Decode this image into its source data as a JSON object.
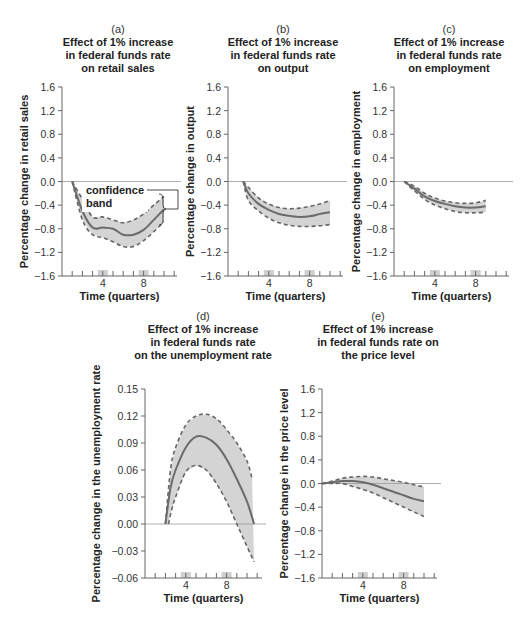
{
  "chart_data": [
    {
      "id": "a",
      "type": "line",
      "letter": "(a)",
      "title_lines": [
        "Effect of 1% increase",
        "in federal funds rate",
        "on retail sales"
      ],
      "xlabel": "Time (quarters)",
      "ylabel": "Percentage change in retail sales",
      "xticks_labeled": [
        4,
        8
      ],
      "ylim": [
        -1.6,
        1.6
      ],
      "yticks": [
        1.6,
        1.2,
        0.8,
        0.4,
        0.0,
        -0.4,
        -0.8,
        -1.2,
        -1.6
      ],
      "ytick_labels": [
        "1.6",
        "1.2",
        "0.8",
        "0.4",
        "0.0",
        "−0.4",
        "−0.8",
        "−1.2",
        "−1.6"
      ],
      "annotation": {
        "lines": [
          "confidence",
          "band"
        ]
      },
      "series": [
        {
          "name": "estimate",
          "x": [
            1,
            2,
            3,
            4,
            5,
            6,
            7,
            8,
            9,
            10
          ],
          "values": [
            0,
            -0.5,
            -0.78,
            -0.78,
            -0.8,
            -0.9,
            -0.9,
            -0.82,
            -0.65,
            -0.47
          ]
        },
        {
          "name": "upper confidence bound",
          "x": [
            1,
            2,
            3,
            4,
            5,
            6,
            7,
            8,
            9,
            10
          ],
          "values": [
            0,
            -0.3,
            -0.6,
            -0.6,
            -0.65,
            -0.7,
            -0.65,
            -0.55,
            -0.4,
            -0.25
          ]
        },
        {
          "name": "lower confidence bound",
          "x": [
            1,
            2,
            3,
            4,
            5,
            6,
            7,
            8,
            9,
            10
          ],
          "values": [
            0,
            -0.65,
            -0.9,
            -0.95,
            -1.02,
            -1.1,
            -1.1,
            -1.0,
            -0.85,
            -0.68
          ]
        }
      ],
      "grid": false
    },
    {
      "id": "b",
      "type": "line",
      "letter": "(b)",
      "title_lines": [
        "Effect of 1% increase",
        "in federal funds rate",
        "on output"
      ],
      "xlabel": "Time (quarters)",
      "ylabel": "Percentage change in output",
      "xticks_labeled": [
        4,
        8
      ],
      "ylim": [
        -1.6,
        1.6
      ],
      "yticks": [
        1.6,
        1.2,
        0.8,
        0.4,
        0.0,
        -0.4,
        -0.8,
        -1.2,
        -1.6
      ],
      "ytick_labels": [
        "1.6",
        "1.2",
        "0.8",
        "0.4",
        "0.0",
        "−0.4",
        "−0.8",
        "−1.2",
        "−1.6"
      ],
      "series": [
        {
          "name": "estimate",
          "x": [
            1.5,
            2,
            3,
            4,
            5,
            6,
            7,
            8,
            9,
            10
          ],
          "values": [
            0,
            -0.2,
            -0.38,
            -0.48,
            -0.55,
            -0.58,
            -0.6,
            -0.59,
            -0.55,
            -0.52
          ]
        },
        {
          "name": "upper confidence bound",
          "x": [
            1.5,
            2,
            3,
            4,
            5,
            6,
            7,
            8,
            9,
            10
          ],
          "values": [
            0,
            -0.1,
            -0.28,
            -0.38,
            -0.44,
            -0.46,
            -0.45,
            -0.42,
            -0.38,
            -0.32
          ]
        },
        {
          "name": "lower confidence bound",
          "x": [
            1.5,
            2,
            3,
            4,
            5,
            6,
            7,
            8,
            9,
            10
          ],
          "values": [
            0,
            -0.32,
            -0.5,
            -0.62,
            -0.7,
            -0.74,
            -0.76,
            -0.76,
            -0.75,
            -0.73
          ]
        }
      ],
      "grid": false
    },
    {
      "id": "c",
      "type": "line",
      "letter": "(c)",
      "title_lines": [
        "Effect of 1% increase",
        "in federal funds rate",
        "on employment"
      ],
      "xlabel": "Time (quarters)",
      "ylabel": "Percentage change in employment",
      "xticks_labeled": [
        4,
        8
      ],
      "ylim": [
        -1.6,
        1.6
      ],
      "yticks": [
        1.6,
        1.2,
        0.8,
        0.4,
        0.0,
        -0.4,
        -0.8,
        -1.2,
        -1.6
      ],
      "ytick_labels": [
        "1.6",
        "1.2",
        "0.8",
        "0.4",
        "0.0",
        "−0.4",
        "−0.8",
        "−1.2",
        "−1.6"
      ],
      "series": [
        {
          "name": "estimate",
          "x": [
            1,
            2,
            3,
            4,
            5,
            6,
            7,
            8,
            9
          ],
          "values": [
            0,
            -0.12,
            -0.25,
            -0.33,
            -0.38,
            -0.42,
            -0.44,
            -0.44,
            -0.42
          ]
        },
        {
          "name": "upper confidence bound",
          "x": [
            1,
            2,
            3,
            4,
            5,
            6,
            7,
            8,
            9
          ],
          "values": [
            0,
            -0.08,
            -0.2,
            -0.28,
            -0.33,
            -0.36,
            -0.37,
            -0.36,
            -0.32
          ]
        },
        {
          "name": "lower confidence bound",
          "x": [
            1,
            2,
            3,
            4,
            5,
            6,
            7,
            8,
            9
          ],
          "values": [
            0,
            -0.16,
            -0.3,
            -0.4,
            -0.46,
            -0.51,
            -0.53,
            -0.53,
            -0.52
          ]
        }
      ],
      "grid": false
    },
    {
      "id": "d",
      "type": "line",
      "letter": "(d)",
      "title_lines": [
        "Effect of 1% increase",
        "in federal funds rate",
        "on the unemployment rate"
      ],
      "xlabel": "Time (quarters)",
      "ylabel": "Percentage change in the unemployment rate",
      "xticks_labeled": [
        4,
        8
      ],
      "ylim": [
        -0.06,
        0.15
      ],
      "yticks": [
        0.15,
        0.12,
        0.09,
        0.06,
        0.03,
        0.0,
        -0.03,
        -0.06
      ],
      "ytick_labels": [
        "0.15",
        "0.12",
        "0.09",
        "0.06",
        "0.03",
        "0.00",
        "−0.03",
        "−0.06"
      ],
      "series": [
        {
          "name": "estimate",
          "x": [
            2,
            2.5,
            3,
            4,
            5,
            6,
            7,
            8,
            9,
            10,
            10.7
          ],
          "values": [
            0,
            0.04,
            0.06,
            0.085,
            0.097,
            0.096,
            0.088,
            0.072,
            0.05,
            0.025,
            0
          ]
        },
        {
          "name": "upper confidence bound",
          "x": [
            2,
            2.5,
            3,
            4,
            5,
            6,
            7,
            8,
            9,
            10,
            10.5
          ],
          "values": [
            0,
            0.06,
            0.085,
            0.11,
            0.12,
            0.122,
            0.117,
            0.105,
            0.09,
            0.07,
            0.05
          ]
        },
        {
          "name": "lower confidence bound",
          "x": [
            2.3,
            2.6,
            3,
            4,
            5,
            6,
            7,
            8,
            9,
            10,
            10.7
          ],
          "values": [
            0,
            0.015,
            0.03,
            0.058,
            0.065,
            0.06,
            0.045,
            0.025,
            0.0,
            -0.025,
            -0.042
          ]
        }
      ],
      "grid": false
    },
    {
      "id": "e",
      "type": "line",
      "letter": "(e)",
      "title_lines": [
        "Effect of 1% increase",
        "in federal funds rate on",
        "the price level"
      ],
      "xlabel": "Time (quarters)",
      "ylabel": "Percentage change in the price level",
      "xticks_labeled": [
        4,
        8
      ],
      "ylim": [
        -1.6,
        1.6
      ],
      "yticks": [
        1.6,
        1.2,
        0.8,
        0.4,
        0.0,
        -0.4,
        -0.8,
        -1.2,
        -1.6
      ],
      "ytick_labels": [
        "1.6",
        "1.2",
        "0.8",
        "0.4",
        "0.0",
        "−0.4",
        "−0.8",
        "−1.2",
        "−1.6"
      ],
      "series": [
        {
          "name": "estimate",
          "x": [
            0,
            1,
            2,
            3,
            4,
            5,
            6,
            7,
            8,
            9,
            10
          ],
          "values": [
            0,
            0.02,
            0.04,
            0.04,
            0.02,
            -0.02,
            -0.08,
            -0.14,
            -0.2,
            -0.26,
            -0.3
          ]
        },
        {
          "name": "upper confidence bound",
          "x": [
            0,
            1,
            2,
            3,
            4,
            5,
            6,
            7,
            8,
            9,
            10
          ],
          "values": [
            0,
            0.04,
            0.09,
            0.11,
            0.12,
            0.11,
            0.08,
            0.05,
            0.02,
            -0.02,
            -0.06
          ]
        },
        {
          "name": "lower confidence bound",
          "x": [
            0,
            1,
            2,
            3,
            4,
            5,
            6,
            7,
            8,
            9,
            10
          ],
          "values": [
            0,
            0.0,
            0.0,
            -0.05,
            -0.1,
            -0.16,
            -0.24,
            -0.32,
            -0.4,
            -0.48,
            -0.56
          ]
        }
      ],
      "grid": false
    }
  ]
}
